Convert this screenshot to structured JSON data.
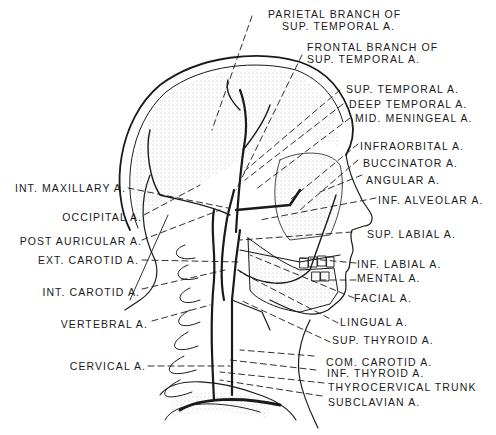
{
  "figure": {
    "ink_color": "#1a1a1a",
    "background": "#ffffff"
  },
  "labels": {
    "right": [
      {
        "id": "parietal",
        "line1": "PARIETAL BRANCH OF",
        "line2": "SUP. TEMPORAL A."
      },
      {
        "id": "frontal",
        "line1": "FRONTAL BRANCH OF",
        "line2": "SUP. TEMPORAL A."
      },
      {
        "id": "sup_temporal",
        "text": "SUP. TEMPORAL A."
      },
      {
        "id": "deep_temporal",
        "text": "DEEP TEMPORAL A."
      },
      {
        "id": "mid_meningeal",
        "text": "MID. MENINGEAL A."
      },
      {
        "id": "infraorbital",
        "text": "INFRAORBITAL A."
      },
      {
        "id": "buccinator",
        "text": "BUCCINATOR A."
      },
      {
        "id": "angular",
        "text": "ANGULAR A."
      },
      {
        "id": "inf_alveolar",
        "text": "INF. ALVEOLAR A."
      },
      {
        "id": "sup_labial",
        "text": "SUP. LABIAL A."
      },
      {
        "id": "inf_labial",
        "text": "INF. LABIAL A."
      },
      {
        "id": "mental",
        "text": "MENTAL A."
      },
      {
        "id": "facial",
        "text": "FACIAL A."
      },
      {
        "id": "lingual",
        "text": "LINGUAL A."
      },
      {
        "id": "sup_thyroid",
        "text": "SUP. THYROID A."
      },
      {
        "id": "com_carotid",
        "text": "COM. CAROTID A."
      },
      {
        "id": "inf_thyroid",
        "text": "INF. THYROID A."
      },
      {
        "id": "thyrocervical",
        "text": "THYROCERVICAL TRUNK"
      },
      {
        "id": "subclavian",
        "text": "SUBCLAVIAN A."
      }
    ],
    "left": [
      {
        "id": "int_maxillary",
        "text": "INT. MAXILLARY A."
      },
      {
        "id": "occipital",
        "text": "OCCIPITAL A."
      },
      {
        "id": "post_auricular",
        "text": "POST AURICULAR A."
      },
      {
        "id": "ext_carotid",
        "text": "EXT. CAROTID A."
      },
      {
        "id": "int_carotid",
        "text": "INT. CAROTID A."
      },
      {
        "id": "vertebral",
        "text": "VERTEBRAL A."
      },
      {
        "id": "cervical",
        "text": "CERVICAL A."
      }
    ]
  }
}
